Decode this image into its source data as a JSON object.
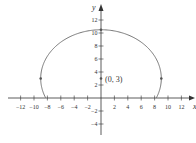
{
  "diagram": {
    "type": "ellipse-arc-graph",
    "x_axis_label": "x",
    "y_axis_label": "y",
    "x_ticks": [
      "−12",
      "−10",
      "−8",
      "−6",
      "−4",
      "−2",
      "2",
      "4",
      "6",
      "8",
      "10",
      "12"
    ],
    "x_tick_values": [
      -12,
      -10,
      -8,
      -6,
      -4,
      -2,
      2,
      4,
      6,
      8,
      10,
      12
    ],
    "y_ticks": [
      "−4",
      "−2",
      "2",
      "4",
      "6",
      "8",
      "10",
      "12"
    ],
    "y_tick_values": [
      -4,
      -2,
      2,
      4,
      6,
      8,
      10,
      12
    ],
    "center_label": "(0, 3)",
    "center": [
      0,
      3
    ],
    "semi_axis_x": 9,
    "semi_axis_y": 7.5,
    "marked_points": [
      [
        -9,
        3
      ],
      [
        9,
        3
      ],
      [
        0,
        10.5
      ],
      [
        0,
        3
      ]
    ],
    "curve_color": "#777777",
    "axis_color": "#333333"
  }
}
